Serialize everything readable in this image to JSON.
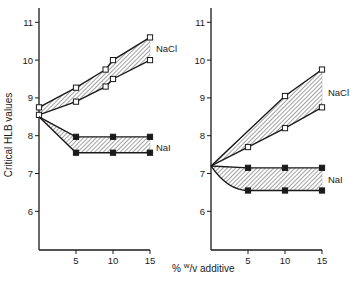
{
  "chart_data": {
    "type": "line",
    "ylabel": "Critical HLB values",
    "xlabel": "% w/v additive",
    "xlabel_parts": {
      "prefix": "% ",
      "sup": "w",
      "suffix": "/v additive"
    },
    "y_ticks": [
      6,
      7,
      8,
      9,
      10,
      11
    ],
    "x_ticks": [
      5,
      10,
      15
    ],
    "ylim": [
      5.0,
      11.5
    ],
    "xlim": [
      0,
      15
    ],
    "grid": false,
    "colors": {
      "line": "#1a1a1a",
      "hatch": "#555555",
      "background": "#ffffff"
    },
    "panels": [
      {
        "id": "left",
        "bands": [
          {
            "label": "NaCl",
            "marker": "open-square",
            "upper": {
              "x": [
                0,
                5,
                9,
                10,
                15
              ],
              "y": [
                8.75,
                9.27,
                9.75,
                10.0,
                10.6
              ]
            },
            "lower": {
              "x": [
                0,
                5,
                9,
                10,
                15
              ],
              "y": [
                8.55,
                8.9,
                9.3,
                9.5,
                10.0
              ]
            },
            "label_pos": {
              "x": 15.8,
              "y": 10.3
            }
          },
          {
            "label": "NaI",
            "marker": "filled-square",
            "upper": {
              "x": [
                0,
                5,
                10,
                15
              ],
              "y": [
                8.5,
                7.97,
                7.97,
                7.97
              ]
            },
            "lower": {
              "x": [
                0,
                5,
                10,
                15
              ],
              "y": [
                8.5,
                7.55,
                7.55,
                7.55
              ]
            },
            "label_pos": {
              "x": 15.8,
              "y": 7.7
            }
          }
        ]
      },
      {
        "id": "right",
        "bands": [
          {
            "label": "NaCl",
            "marker": "open-square",
            "upper": {
              "x": [
                0,
                10,
                15
              ],
              "y": [
                7.2,
                9.05,
                9.75
              ]
            },
            "lower": {
              "x": [
                0,
                5,
                10,
                15
              ],
              "y": [
                7.2,
                7.7,
                8.2,
                8.75
              ]
            },
            "label_pos": {
              "x": 15.8,
              "y": 9.15
            }
          },
          {
            "label": "NaI",
            "marker": "filled-square",
            "upper": {
              "x": [
                0,
                5,
                10,
                15
              ],
              "y": [
                7.2,
                7.15,
                7.15,
                7.15
              ]
            },
            "lower": {
              "x": [
                0,
                5,
                10,
                15
              ],
              "y": [
                7.2,
                6.55,
                6.55,
                6.55
              ]
            },
            "lower_curved": true,
            "label_pos": {
              "x": 15.8,
              "y": 6.85
            }
          }
        ]
      }
    ]
  },
  "layout": {
    "panels": [
      {
        "axis_x": 39,
        "x_per_unit": 7.4,
        "baseline_y": 250,
        "y_top": 8
      },
      {
        "axis_x": 211,
        "x_per_unit": 7.4,
        "baseline_y": 250,
        "y_top": 8
      }
    ],
    "y_zero_px": 173.5,
    "y_per_unit": 37.8
  }
}
